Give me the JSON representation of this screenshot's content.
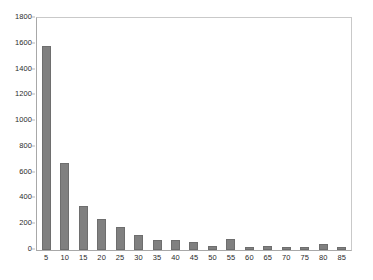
{
  "chart_data": {
    "type": "bar",
    "title": "",
    "subtitle": "",
    "xlabel": "",
    "ylabel": "",
    "categories": [
      "5",
      "10",
      "15",
      "20",
      "25",
      "30",
      "35",
      "40",
      "45",
      "50",
      "55",
      "60",
      "65",
      "70",
      "75",
      "80",
      "85"
    ],
    "values": [
      1580,
      675,
      340,
      240,
      178,
      118,
      78,
      75,
      60,
      35,
      85,
      22,
      28,
      20,
      22,
      45,
      22
    ],
    "series": [
      {
        "name": "Frequency",
        "values": [
          1580,
          675,
          340,
          240,
          178,
          118,
          78,
          75,
          60,
          35,
          85,
          22,
          28,
          20,
          22,
          45,
          22
        ]
      }
    ],
    "ylim": [
      0,
      1800
    ],
    "ytick_values": [
      0,
      200,
      400,
      600,
      800,
      1000,
      1200,
      1400,
      1600,
      1800
    ],
    "ytick_labels": [
      "0",
      "200",
      "400",
      "600",
      "800",
      "1000",
      "1200",
      "1400",
      "1600",
      "1800"
    ],
    "xtick_labels": [
      "5",
      "10",
      "15",
      "20",
      "25",
      "30",
      "35",
      "40",
      "45",
      "50",
      "55",
      "60",
      "65",
      "70",
      "75",
      "80",
      "85"
    ],
    "grid": false,
    "legend": false,
    "legend_position": "none",
    "bar_color": "#808080",
    "bar_edge_color": "#6e6e6e",
    "plot_background": "#ffffff",
    "axis_color": "#a8a8a8",
    "tick_label_color": "#2b2b2b",
    "annotations": []
  }
}
